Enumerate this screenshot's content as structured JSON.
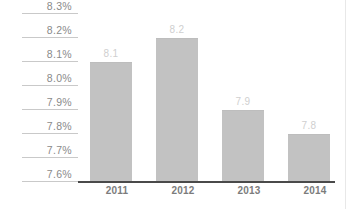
{
  "chart_data": {
    "type": "bar",
    "title": "",
    "subtitle": "",
    "xlabel": "",
    "ylabel": "",
    "categories": [
      "2011",
      "2012",
      "2013",
      "2014"
    ],
    "values": [
      8.1,
      8.2,
      7.9,
      7.8
    ],
    "value_labels": [
      "8.1",
      "8.2",
      "7.9",
      "7.8"
    ],
    "ylim": [
      7.6,
      8.3
    ],
    "y_tick_labels": [
      "8.3%",
      "8.2%",
      "8.1%",
      "8.0%",
      "7.9%",
      "7.8%",
      "7.7%",
      "7.6%"
    ],
    "y_tick_values": [
      8.3,
      8.2,
      8.1,
      8.0,
      7.9,
      7.8,
      7.7,
      7.6
    ],
    "grid": "y-axis label underlines only",
    "legend": "none",
    "series": [
      {
        "name": "",
        "values": [
          8.1,
          8.2,
          7.9,
          7.8
        ]
      }
    ],
    "colors": {
      "bar_fill": "#c2c2c2",
      "axis_line": "#4a4a4a",
      "y_label_text": "#8a8a8a",
      "x_label_text": "#7c7c7c",
      "value_label_text": "#cfcfcf",
      "grid_stub": "#c9c9c9",
      "background": "#ffffff"
    }
  }
}
